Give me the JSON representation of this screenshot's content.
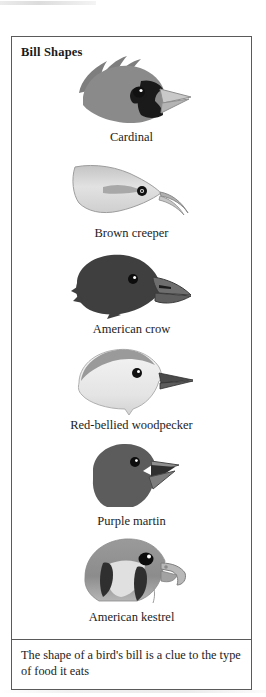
{
  "figure": {
    "title": "Bill Shapes",
    "caption": "The shape of a bird's bill is a clue to the type of food it eats",
    "border_color": "#5a5a5a",
    "background_color": "#ffffff",
    "birds": [
      {
        "label": "Cardinal",
        "bill_type": "conical seed-cracking bill",
        "head_color": "#8a8a8a",
        "mask_color": "#1a1a1a",
        "bill_color": "#c9c9c9",
        "eye_color": "#111111"
      },
      {
        "label": "Brown creeper",
        "bill_type": "thin decurved probing bill",
        "head_color": "#d8d8d8",
        "mask_color": "#a8a8a8",
        "bill_color": "#bdbdbd",
        "eye_color": "#111111"
      },
      {
        "label": "American crow",
        "bill_type": "heavy all-purpose bill",
        "head_color": "#3f3f3f",
        "mask_color": "#2b2b2b",
        "bill_color": "#6e6e6e",
        "eye_color": "#111111"
      },
      {
        "label": "Red-bellied woodpecker",
        "bill_type": "straight chisel bill",
        "head_color": "#efefef",
        "mask_color": "#9a9a9a",
        "bill_color": "#4a4a4a",
        "eye_color": "#111111"
      },
      {
        "label": "Purple martin",
        "bill_type": "short wide gaping bill",
        "head_color": "#5c5c5c",
        "mask_color": "#3a3a3a",
        "bill_color": "#8f8f8f",
        "eye_color": "#111111"
      },
      {
        "label": "American kestrel",
        "bill_type": "hooked raptor bill",
        "head_color": "#8f8f8f",
        "mask_color": "#2f2f2f",
        "bill_color": "#b8b8b8",
        "eye_color": "#111111"
      }
    ]
  }
}
